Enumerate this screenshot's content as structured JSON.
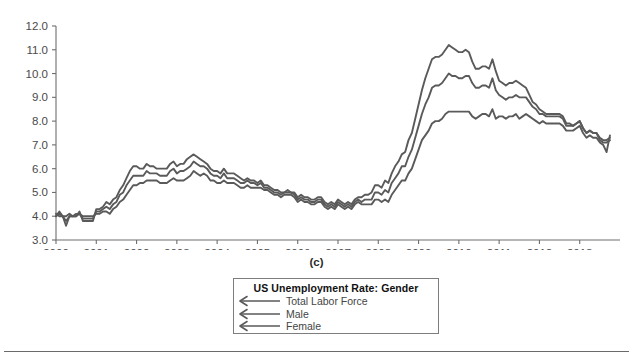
{
  "figure": {
    "panel_caption": "(c)",
    "background_color": "#ffffff",
    "line_color": "#5a5a5a",
    "axis_color": "#6e6e6e"
  },
  "legend": {
    "title": "US Unemployment Rate: Gender",
    "marker_icon": "left-arrow-icon",
    "entries": [
      {
        "label": "Total Labor Force"
      },
      {
        "label": "Male"
      },
      {
        "label": "Female"
      }
    ]
  },
  "chart_data": {
    "type": "line",
    "title": "US Unemployment Rate: Gender",
    "xlabel": "",
    "ylabel": "",
    "xlim": [
      2000.0,
      2014.0
    ],
    "ylim": [
      3.0,
      12.0
    ],
    "grid": false,
    "legend_position": "below-plot",
    "ytick_labels": [
      "3.0",
      "4.0",
      "5.0",
      "6.0",
      "7.0",
      "8.0",
      "9.0",
      "10.0",
      "11.0",
      "12.0"
    ],
    "ytick_values": [
      3.0,
      4.0,
      5.0,
      6.0,
      7.0,
      8.0,
      9.0,
      10.0,
      11.0,
      12.0
    ],
    "xtick_labels": [
      "2000",
      "2001",
      "2002",
      "2003",
      "2004",
      "2005",
      "2006",
      "2007",
      "2008",
      "2009",
      "2010",
      "2011",
      "2012",
      "2013"
    ],
    "xtick_values": [
      2000,
      2001,
      2002,
      2003,
      2004,
      2005,
      2006,
      2007,
      2008,
      2009,
      2010,
      2011,
      2012,
      2013
    ],
    "x": [
      2000.0,
      2000.083,
      2000.167,
      2000.25,
      2000.333,
      2000.417,
      2000.5,
      2000.583,
      2000.667,
      2000.75,
      2000.833,
      2000.917,
      2001.0,
      2001.083,
      2001.167,
      2001.25,
      2001.333,
      2001.417,
      2001.5,
      2001.583,
      2001.667,
      2001.75,
      2001.833,
      2001.917,
      2002.0,
      2002.083,
      2002.167,
      2002.25,
      2002.333,
      2002.417,
      2002.5,
      2002.583,
      2002.667,
      2002.75,
      2002.833,
      2002.917,
      2003.0,
      2003.083,
      2003.167,
      2003.25,
      2003.333,
      2003.417,
      2003.5,
      2003.583,
      2003.667,
      2003.75,
      2003.833,
      2003.917,
      2004.0,
      2004.083,
      2004.167,
      2004.25,
      2004.333,
      2004.417,
      2004.5,
      2004.583,
      2004.667,
      2004.75,
      2004.833,
      2004.917,
      2005.0,
      2005.083,
      2005.167,
      2005.25,
      2005.333,
      2005.417,
      2005.5,
      2005.583,
      2005.667,
      2005.75,
      2005.833,
      2005.917,
      2006.0,
      2006.083,
      2006.167,
      2006.25,
      2006.333,
      2006.417,
      2006.5,
      2006.583,
      2006.667,
      2006.75,
      2006.833,
      2006.917,
      2007.0,
      2007.083,
      2007.167,
      2007.25,
      2007.333,
      2007.417,
      2007.5,
      2007.583,
      2007.667,
      2007.75,
      2007.833,
      2007.917,
      2008.0,
      2008.083,
      2008.167,
      2008.25,
      2008.333,
      2008.417,
      2008.5,
      2008.583,
      2008.667,
      2008.75,
      2008.833,
      2008.917,
      2009.0,
      2009.083,
      2009.167,
      2009.25,
      2009.333,
      2009.417,
      2009.5,
      2009.583,
      2009.667,
      2009.75,
      2009.833,
      2009.917,
      2010.0,
      2010.083,
      2010.167,
      2010.25,
      2010.333,
      2010.417,
      2010.5,
      2010.583,
      2010.667,
      2010.75,
      2010.833,
      2010.917,
      2011.0,
      2011.083,
      2011.167,
      2011.25,
      2011.333,
      2011.417,
      2011.5,
      2011.583,
      2011.667,
      2011.75,
      2011.833,
      2011.917,
      2012.0,
      2012.083,
      2012.167,
      2012.25,
      2012.333,
      2012.417,
      2012.5,
      2012.583,
      2012.667,
      2012.75,
      2012.833,
      2012.917,
      2013.0,
      2013.083,
      2013.167,
      2013.25,
      2013.333,
      2013.417,
      2013.5,
      2013.583,
      2013.667,
      2013.75
    ],
    "series": [
      {
        "name": "Total Labor Force",
        "values": [
          4.0,
          4.1,
          4.0,
          3.8,
          4.0,
          4.0,
          4.0,
          4.1,
          3.9,
          3.9,
          3.9,
          3.9,
          4.2,
          4.2,
          4.3,
          4.4,
          4.3,
          4.5,
          4.6,
          4.9,
          5.0,
          5.3,
          5.5,
          5.7,
          5.7,
          5.7,
          5.7,
          5.9,
          5.8,
          5.8,
          5.8,
          5.7,
          5.7,
          5.7,
          5.9,
          6.0,
          5.8,
          5.9,
          5.9,
          6.0,
          6.1,
          6.3,
          6.2,
          6.1,
          6.1,
          6.0,
          5.8,
          5.7,
          5.7,
          5.6,
          5.8,
          5.6,
          5.6,
          5.6,
          5.5,
          5.4,
          5.4,
          5.5,
          5.4,
          5.4,
          5.3,
          5.4,
          5.2,
          5.2,
          5.1,
          5.0,
          5.0,
          4.9,
          5.0,
          5.0,
          5.0,
          4.9,
          4.7,
          4.8,
          4.7,
          4.7,
          4.6,
          4.6,
          4.7,
          4.7,
          4.5,
          4.4,
          4.5,
          4.4,
          4.6,
          4.5,
          4.4,
          4.5,
          4.4,
          4.6,
          4.7,
          4.6,
          4.7,
          4.7,
          4.7,
          5.0,
          5.0,
          4.9,
          5.1,
          5.0,
          5.4,
          5.6,
          5.8,
          6.1,
          6.1,
          6.5,
          6.8,
          7.3,
          7.8,
          8.3,
          8.7,
          9.0,
          9.4,
          9.5,
          9.5,
          9.6,
          9.8,
          10.0,
          9.9,
          9.9,
          9.8,
          9.8,
          9.9,
          9.9,
          9.6,
          9.4,
          9.4,
          9.5,
          9.5,
          9.4,
          9.8,
          9.3,
          9.1,
          9.0,
          8.9,
          9.0,
          9.0,
          9.1,
          9.0,
          9.0,
          9.0,
          8.8,
          8.6,
          8.5,
          8.3,
          8.3,
          8.2,
          8.2,
          8.2,
          8.2,
          8.2,
          8.1,
          7.8,
          7.8,
          7.8,
          7.9,
          8.0,
          7.7,
          7.5,
          7.6,
          7.5,
          7.5,
          7.3,
          7.2,
          7.2,
          7.3
        ]
      },
      {
        "name": "Male",
        "values": [
          4.0,
          4.2,
          4.0,
          3.6,
          4.0,
          4.0,
          4.0,
          4.2,
          3.8,
          3.8,
          3.8,
          3.8,
          4.3,
          4.3,
          4.4,
          4.6,
          4.5,
          4.7,
          4.8,
          5.1,
          5.3,
          5.6,
          5.9,
          6.1,
          6.1,
          6.0,
          6.0,
          6.2,
          6.1,
          6.1,
          6.0,
          6.0,
          6.0,
          6.0,
          6.2,
          6.3,
          6.1,
          6.2,
          6.2,
          6.4,
          6.5,
          6.6,
          6.5,
          6.4,
          6.3,
          6.2,
          6.0,
          5.9,
          5.9,
          5.8,
          6.0,
          5.8,
          5.8,
          5.8,
          5.7,
          5.6,
          5.5,
          5.6,
          5.5,
          5.5,
          5.4,
          5.5,
          5.3,
          5.3,
          5.2,
          5.1,
          5.1,
          5.0,
          5.0,
          5.1,
          5.0,
          5.0,
          4.8,
          4.9,
          4.8,
          4.8,
          4.7,
          4.7,
          4.8,
          4.8,
          4.6,
          4.5,
          4.6,
          4.5,
          4.7,
          4.6,
          4.5,
          4.6,
          4.5,
          4.7,
          4.8,
          4.8,
          4.9,
          4.9,
          5.0,
          5.3,
          5.3,
          5.2,
          5.5,
          5.4,
          5.8,
          6.1,
          6.3,
          6.6,
          6.7,
          7.2,
          7.5,
          8.1,
          8.7,
          9.3,
          9.8,
          10.2,
          10.6,
          10.7,
          10.7,
          10.8,
          11.0,
          11.2,
          11.1,
          11.0,
          10.9,
          10.9,
          11.0,
          10.9,
          10.5,
          10.2,
          10.2,
          10.3,
          10.3,
          10.2,
          10.6,
          10.1,
          9.7,
          9.6,
          9.5,
          9.6,
          9.6,
          9.7,
          9.6,
          9.5,
          9.4,
          9.1,
          8.8,
          8.7,
          8.5,
          8.4,
          8.3,
          8.3,
          8.3,
          8.3,
          8.3,
          8.2,
          7.9,
          7.9,
          7.8,
          7.9,
          8.0,
          7.7,
          7.5,
          7.6,
          7.5,
          7.5,
          7.2,
          7.1,
          7.1,
          7.2
        ]
      },
      {
        "name": "Female",
        "values": [
          4.1,
          4.0,
          4.0,
          4.0,
          4.1,
          4.0,
          4.1,
          4.1,
          4.0,
          4.0,
          4.0,
          4.0,
          4.1,
          4.1,
          4.2,
          4.2,
          4.1,
          4.3,
          4.4,
          4.6,
          4.7,
          4.9,
          5.1,
          5.3,
          5.3,
          5.4,
          5.4,
          5.5,
          5.5,
          5.5,
          5.5,
          5.4,
          5.4,
          5.4,
          5.5,
          5.6,
          5.5,
          5.5,
          5.5,
          5.6,
          5.7,
          5.9,
          5.8,
          5.7,
          5.8,
          5.7,
          5.5,
          5.5,
          5.4,
          5.4,
          5.5,
          5.4,
          5.4,
          5.4,
          5.3,
          5.2,
          5.2,
          5.3,
          5.2,
          5.2,
          5.2,
          5.2,
          5.1,
          5.1,
          5.0,
          4.9,
          4.9,
          4.8,
          4.9,
          4.9,
          4.9,
          4.8,
          4.6,
          4.7,
          4.6,
          4.6,
          4.5,
          4.5,
          4.6,
          4.6,
          4.4,
          4.3,
          4.4,
          4.3,
          4.5,
          4.4,
          4.3,
          4.4,
          4.3,
          4.5,
          4.6,
          4.5,
          4.5,
          4.5,
          4.5,
          4.7,
          4.7,
          4.6,
          4.7,
          4.6,
          4.9,
          5.1,
          5.3,
          5.5,
          5.5,
          5.8,
          6.0,
          6.4,
          6.8,
          7.2,
          7.4,
          7.6,
          7.9,
          8.0,
          8.0,
          8.1,
          8.3,
          8.4,
          8.4,
          8.4,
          8.4,
          8.4,
          8.4,
          8.4,
          8.2,
          8.1,
          8.2,
          8.3,
          8.3,
          8.2,
          8.5,
          8.1,
          8.2,
          8.2,
          8.1,
          8.2,
          8.2,
          8.3,
          8.1,
          8.2,
          8.3,
          8.2,
          8.1,
          8.0,
          7.9,
          8.0,
          7.9,
          7.9,
          7.9,
          7.9,
          7.9,
          7.8,
          7.6,
          7.6,
          7.6,
          7.7,
          7.8,
          7.5,
          7.3,
          7.4,
          7.3,
          7.3,
          7.1,
          7.0,
          6.7,
          7.4
        ]
      }
    ]
  }
}
